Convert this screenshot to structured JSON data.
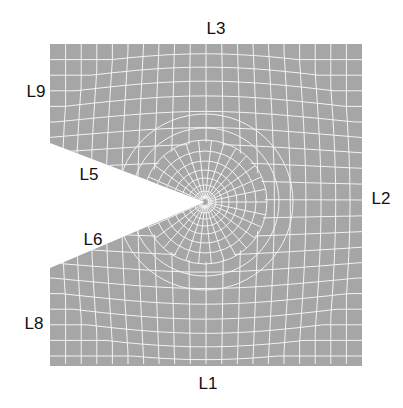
{
  "diagram": {
    "type": "finite-element-mesh",
    "colors": {
      "fill": "#a6a6a6",
      "mesh_lines": "#f0f0f0",
      "background": "#ffffff",
      "text": "#111111"
    },
    "edges": [
      {
        "id": "L1",
        "label": "L1",
        "position": "bottom"
      },
      {
        "id": "L2",
        "label": "L2",
        "position": "right"
      },
      {
        "id": "L3",
        "label": "L3",
        "position": "top"
      },
      {
        "id": "L5",
        "label": "L5",
        "position": "upper notch flank"
      },
      {
        "id": "L6",
        "label": "L6",
        "position": "lower notch flank"
      },
      {
        "id": "L8",
        "label": "L8",
        "position": "left lower"
      },
      {
        "id": "L9",
        "label": "L9",
        "position": "left upper"
      }
    ]
  }
}
